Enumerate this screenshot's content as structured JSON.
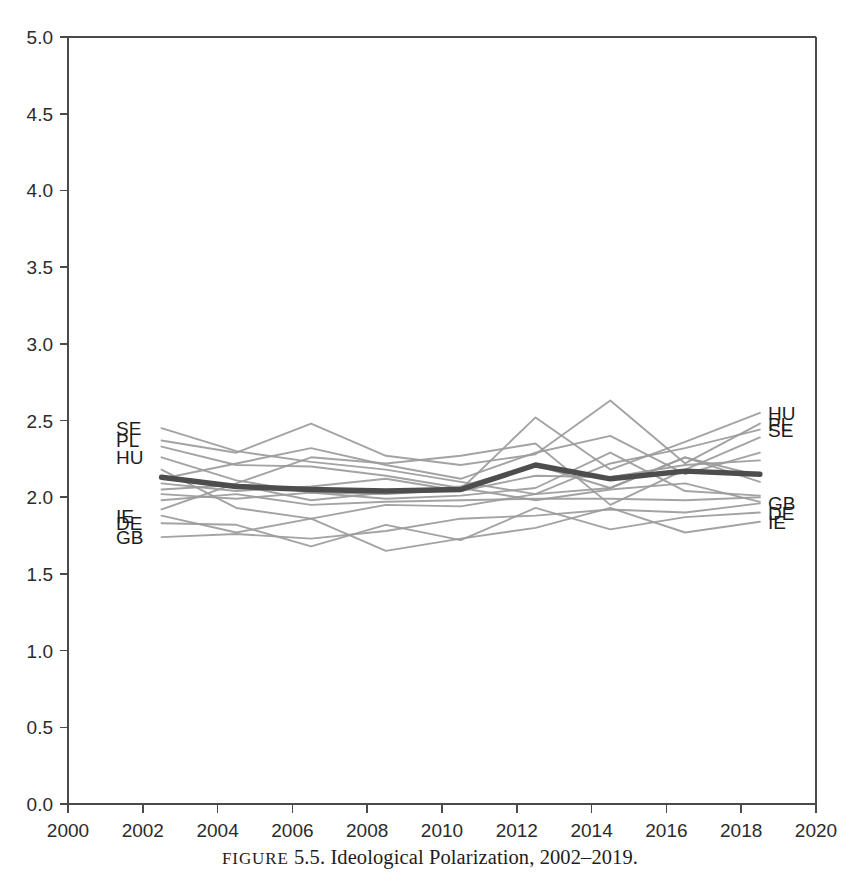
{
  "caption": {
    "figure_word": "FIGURE",
    "number": "5.5.",
    "text": "Ideological Polarization, 2002–2019."
  },
  "chart_data": {
    "type": "line",
    "title": "Ideological Polarization, 2002–2019",
    "xlabel": "",
    "ylabel": "",
    "xlim": [
      2000,
      2020
    ],
    "ylim": [
      0.0,
      5.0
    ],
    "grid": false,
    "legend": "inline-endpoint-labels",
    "x_ticks": [
      2000,
      2002,
      2004,
      2006,
      2008,
      2010,
      2012,
      2014,
      2016,
      2018,
      2020
    ],
    "y_ticks": [
      "0.0",
      "0.5",
      "1.0",
      "1.5",
      "2.0",
      "2.5",
      "3.0",
      "3.5",
      "4.0",
      "4.5",
      "5.0"
    ],
    "x": [
      2002.5,
      2004.5,
      2006.5,
      2008.5,
      2010.5,
      2012.5,
      2014.5,
      2016.5,
      2018.5
    ],
    "labeled_left": [
      "SE",
      "PL",
      "HU",
      "IE",
      "DE",
      "GB"
    ],
    "labeled_right": [
      "HU",
      "PL",
      "SE",
      "GB",
      "DE",
      "IE"
    ],
    "series": [
      {
        "name": "SE",
        "highlight": false,
        "label_left": "SE",
        "label_right": "SE",
        "values": [
          2.45,
          2.3,
          2.23,
          2.18,
          2.1,
          2.02,
          2.22,
          2.32,
          2.44
        ]
      },
      {
        "name": "PL",
        "highlight": false,
        "label_left": "PL",
        "label_right": "PL",
        "values": [
          2.37,
          2.29,
          2.48,
          2.27,
          2.21,
          2.28,
          2.63,
          2.22,
          2.48
        ]
      },
      {
        "name": "HU",
        "highlight": false,
        "label_left": "HU",
        "label_right": "HU",
        "values": [
          2.26,
          2.11,
          2.03,
          2.02,
          2.05,
          2.52,
          2.18,
          2.36,
          2.55
        ]
      },
      {
        "name": "C4",
        "highlight": false,
        "label_left": "",
        "label_right": "",
        "values": [
          2.12,
          2.22,
          2.32,
          2.21,
          2.12,
          2.29,
          2.4,
          2.15,
          2.29
        ]
      },
      {
        "name": "C5",
        "highlight": false,
        "label_left": "",
        "label_right": "",
        "values": [
          2.09,
          2.04,
          2.07,
          2.12,
          2.04,
          2.14,
          2.13,
          2.21,
          2.24
        ]
      },
      {
        "name": "C6",
        "highlight": false,
        "label_left": "",
        "label_right": "",
        "values": [
          2.05,
          2.08,
          1.98,
          2.03,
          2.07,
          2.21,
          2.06,
          2.26,
          2.14
        ]
      },
      {
        "name": "C7",
        "highlight": false,
        "label_left": "",
        "label_right": "",
        "values": [
          2.02,
          1.99,
          2.03,
          1.99,
          2.01,
          2.06,
          2.29,
          2.04,
          2.01
        ]
      },
      {
        "name": "C8",
        "highlight": false,
        "label_left": "",
        "label_right": "",
        "values": [
          1.98,
          2.02,
          1.95,
          1.97,
          1.98,
          1.99,
          1.99,
          1.98,
          2.0
        ]
      },
      {
        "name": "C9",
        "highlight": false,
        "label_left": "",
        "label_right": "",
        "values": [
          2.33,
          2.21,
          2.2,
          2.14,
          2.06,
          1.98,
          2.05,
          2.09,
          1.97
        ]
      },
      {
        "name": "GB",
        "highlight": false,
        "label_left": "GB",
        "label_right": "GB",
        "values": [
          1.74,
          1.76,
          1.73,
          1.78,
          1.86,
          1.88,
          1.92,
          1.9,
          1.96
        ]
      },
      {
        "name": "DE",
        "highlight": false,
        "label_left": "DE",
        "label_right": "DE",
        "values": [
          1.83,
          1.82,
          1.68,
          1.82,
          1.72,
          1.93,
          1.79,
          1.87,
          1.9
        ]
      },
      {
        "name": "IE",
        "highlight": false,
        "label_left": "IE",
        "label_right": "IE",
        "values": [
          1.88,
          1.77,
          1.86,
          1.65,
          1.73,
          1.8,
          1.93,
          1.77,
          1.84
        ]
      },
      {
        "name": "C13",
        "highlight": false,
        "label_left": "",
        "label_right": "",
        "values": [
          2.18,
          1.93,
          1.86,
          1.95,
          1.94,
          2.02,
          2.06,
          2.26,
          2.1
        ]
      },
      {
        "name": "C14",
        "highlight": false,
        "label_left": "",
        "label_right": "",
        "values": [
          1.92,
          2.09,
          2.26,
          2.22,
          2.27,
          2.35,
          1.95,
          2.18,
          2.39
        ]
      },
      {
        "name": "MEAN",
        "highlight": true,
        "label_left": "",
        "label_right": "",
        "values": [
          2.13,
          2.07,
          2.05,
          2.04,
          2.05,
          2.21,
          2.12,
          2.17,
          2.15
        ]
      }
    ]
  },
  "axes": {
    "y_tick_labels": [
      "5.0",
      "4.5",
      "4.0",
      "3.5",
      "3.0",
      "2.5",
      "2.0",
      "1.5",
      "1.0",
      "0.5",
      "0.0"
    ],
    "x_tick_labels": [
      "2000",
      "2002",
      "2004",
      "2006",
      "2008",
      "2010",
      "2012",
      "2014",
      "2016",
      "2018",
      "2020"
    ]
  },
  "endpoint_labels": {
    "left": [
      {
        "text": "SE",
        "value": 2.45
      },
      {
        "text": "PL",
        "value": 2.37
      },
      {
        "text": "HU",
        "value": 2.26
      },
      {
        "text": "IE",
        "value": 1.88
      },
      {
        "text": "DE",
        "value": 1.83
      },
      {
        "text": "GB",
        "value": 1.74
      }
    ],
    "right": [
      {
        "text": "HU",
        "value": 2.55
      },
      {
        "text": "PL",
        "value": 2.48
      },
      {
        "text": "SE",
        "value": 2.44
      },
      {
        "text": "GB",
        "value": 1.96
      },
      {
        "text": "DE",
        "value": 1.9
      },
      {
        "text": "IE",
        "value": 1.84
      }
    ]
  },
  "colors": {
    "line": "#9b9b9b",
    "mean_line": "#4d4d4d",
    "axis": "#4a4a4a",
    "text": "#1d1d1d",
    "background": "#ffffff"
  }
}
